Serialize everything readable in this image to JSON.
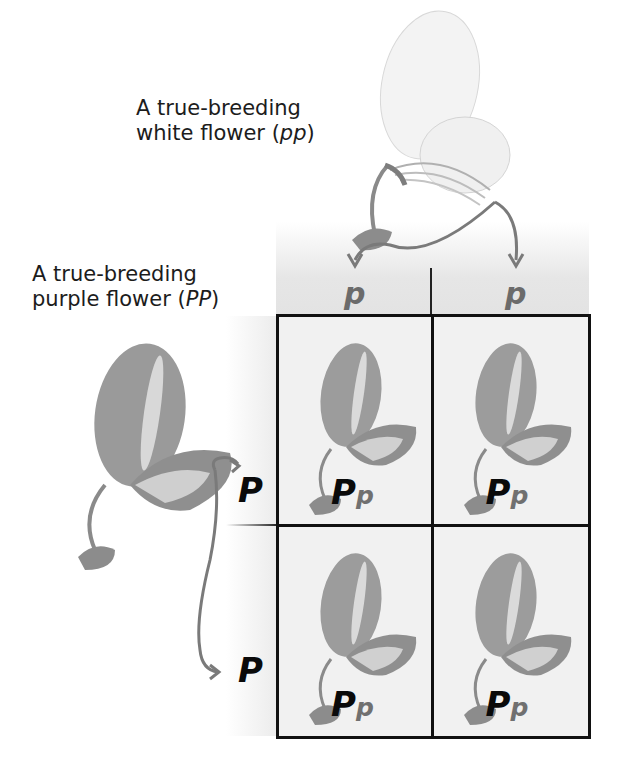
{
  "labels": {
    "white_parent": {
      "line1": "A true-breeding",
      "line2_prefix": "white flower (",
      "genotype": "pp",
      "line2_suffix": ")"
    },
    "purple_parent": {
      "line1": "A true-breeding",
      "line2_prefix": "purple flower (",
      "genotype": "PP",
      "line2_suffix": ")"
    }
  },
  "punnett": {
    "column_alleles": [
      "p",
      "p"
    ],
    "row_alleles": [
      "P",
      "P"
    ],
    "cells": [
      {
        "dominant": "P",
        "recessive": "p"
      },
      {
        "dominant": "P",
        "recessive": "p"
      },
      {
        "dominant": "P",
        "recessive": "p"
      },
      {
        "dominant": "P",
        "recessive": "p"
      }
    ]
  },
  "colors": {
    "dominant_allele": "#0a0a0a",
    "recessive_allele": "#6b6b6b",
    "arrow": "#7a7a7a",
    "grid_line": "#111111",
    "cell_bg": "#f1f1f1"
  }
}
